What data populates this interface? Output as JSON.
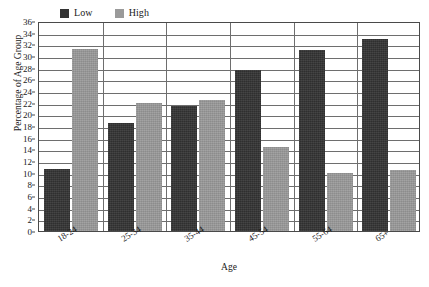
{
  "chart_data": {
    "type": "bar",
    "title": "",
    "xlabel": "Age",
    "ylabel": "Percentage of Age Group",
    "categories": [
      "18-24",
      "25-34",
      "35-44",
      "45-54",
      "55-64",
      "65+"
    ],
    "series": [
      {
        "name": "Low",
        "color": "#333333",
        "values": [
          10.7,
          18.5,
          21.5,
          27.6,
          31.0,
          32.9
        ]
      },
      {
        "name": "High",
        "color": "#9a9a9a",
        "values": [
          31.2,
          22.0,
          22.5,
          14.4,
          9.9,
          10.5
        ]
      }
    ],
    "ylim": [
      0,
      36
    ],
    "ytick_step": 2,
    "yticks": [
      0,
      2,
      4,
      6,
      8,
      10,
      12,
      14,
      16,
      18,
      20,
      22,
      24,
      26,
      28,
      30,
      32,
      34,
      36
    ],
    "grid": true,
    "grid_axis": "y",
    "legend_position": "top-left",
    "group_separators": true
  },
  "legend": {
    "entries": [
      {
        "label": "Low",
        "swatch": "dark-square-swatch"
      },
      {
        "label": "High",
        "swatch": "gray-square-swatch"
      }
    ]
  },
  "axes": {
    "y_title": "Percentage of Age Group",
    "x_title": "Age"
  }
}
